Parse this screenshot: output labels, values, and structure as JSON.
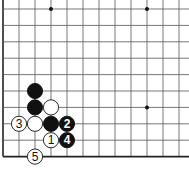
{
  "diagram": {
    "type": "go-board-corner",
    "grid": {
      "columns_x": [
        3,
        19,
        35,
        51,
        67,
        83,
        99,
        115,
        131,
        147,
        163,
        179
      ],
      "rows_y": [
        9,
        25.4,
        41.8,
        58.2,
        74.6,
        91,
        107.4,
        123.8,
        140.2,
        156.6
      ],
      "left_edge": true,
      "bottom_edge": true,
      "line_color": "#555555",
      "edge_color": "#222222"
    },
    "star_points": [
      {
        "col": 3,
        "row": 0
      },
      {
        "col": 9,
        "row": 0
      },
      {
        "col": 9,
        "row": 6
      }
    ],
    "stones": [
      {
        "col": 2,
        "row": 5,
        "color": "black",
        "label": ""
      },
      {
        "col": 2,
        "row": 6,
        "color": "black",
        "label": ""
      },
      {
        "col": 3,
        "row": 6,
        "color": "white",
        "label": ""
      },
      {
        "col": 1,
        "row": 7,
        "color": "white",
        "label": "3"
      },
      {
        "col": 2,
        "row": 7,
        "color": "white",
        "label": ""
      },
      {
        "col": 3,
        "row": 7,
        "color": "black",
        "label": ""
      },
      {
        "col": 4,
        "row": 7,
        "color": "black",
        "label": "2"
      },
      {
        "col": 3,
        "row": 8,
        "color": "white",
        "label": "1"
      },
      {
        "col": 4,
        "row": 8,
        "color": "black",
        "label": "4"
      },
      {
        "col": 2,
        "row": 9,
        "color": "white",
        "label": "5"
      }
    ],
    "stone_radius": 7.6,
    "colors": {
      "black_stone": "#111111",
      "white_stone": "#ffffff",
      "stone_outline": "#111111",
      "label_on_black": "#ffffff",
      "label_on_white": "#111111"
    }
  }
}
